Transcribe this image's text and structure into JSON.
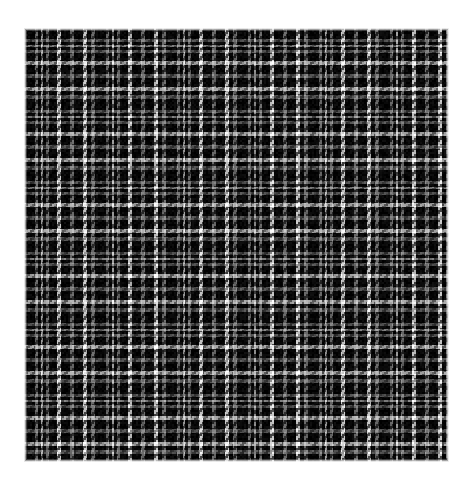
{
  "image": {
    "kind": "fabric-swatch",
    "subject": "tartan-plaid-weave",
    "width": 473,
    "height": 487,
    "background_color": "#ffffff",
    "description": "Black and white tartan plaid woven fabric swatch on a plain white background"
  },
  "swatch": {
    "name": "plaid-swatch",
    "left": 24,
    "top": 28,
    "right": 449,
    "bottom": 462,
    "width": 425,
    "height": 434,
    "edge_softness_px": 3
  },
  "palette": {
    "white": "#ffffff",
    "light_gray": "#c9c9c9",
    "mid_gray": "#8c8c8c",
    "dark_gray": "#3c3c3c",
    "near_black": "#101010",
    "black": "#050505",
    "background": "#ffffff"
  },
  "weave": {
    "type": "twill",
    "thread_px": 2,
    "twill_step": 1,
    "twill_run": 2,
    "warp_weft_contrast": 0.18,
    "slub_noise": 0.08,
    "vertical_striation": 0.1
  },
  "sett": {
    "repeat_px": 70.8,
    "symmetric": true,
    "note": "Identical stripe sequence used for warp (vertical) and weft (horizontal) giving a square balanced check",
    "stripes": [
      {
        "color": "near_black",
        "width": 11
      },
      {
        "color": "mid_gray",
        "width": 3
      },
      {
        "color": "near_black",
        "width": 3
      },
      {
        "color": "light_gray",
        "width": 2
      },
      {
        "color": "near_black",
        "width": 3
      },
      {
        "color": "mid_gray",
        "width": 3
      },
      {
        "color": "near_black",
        "width": 8
      },
      {
        "color": "white",
        "width": 4
      },
      {
        "color": "near_black",
        "width": 9
      },
      {
        "color": "mid_gray",
        "width": 4
      },
      {
        "color": "near_black",
        "width": 9
      },
      {
        "color": "white",
        "width": 4
      },
      {
        "color": "near_black",
        "width": 4
      },
      {
        "color": "mid_gray",
        "width": 3.8
      }
    ]
  },
  "chart_data": {
    "type": "heatmap",
    "xlabel": "warp threads",
    "ylabel": "weft threads",
    "categories": [
      "near_black",
      "mid_gray",
      "near_black",
      "light_gray",
      "near_black",
      "mid_gray",
      "near_black",
      "white",
      "near_black",
      "mid_gray",
      "near_black",
      "white",
      "near_black",
      "mid_gray"
    ],
    "values": [
      11,
      3,
      3,
      2,
      3,
      3,
      8,
      4,
      9,
      4,
      9,
      4,
      4,
      3.8
    ],
    "repeats_across": 6,
    "repeats_down": 6.1
  }
}
